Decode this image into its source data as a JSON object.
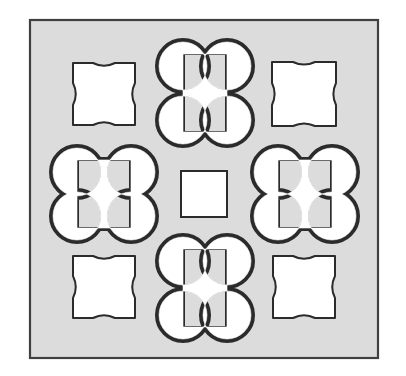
{
  "figure": {
    "kind": "geometric-tiling-pattern",
    "canvas": {
      "width": 406,
      "height": 376,
      "background": "#ffffff"
    },
    "frame": {
      "name": "outer-square-panel",
      "x": 30,
      "y": 20,
      "width": 348,
      "height": 338,
      "fill": "#dcdcdc",
      "stroke": "#404040",
      "stroke_width": 2.2
    },
    "shape_style": {
      "fill": "#ffffff",
      "stroke": "#2b2b2b",
      "stroke_width": 2.0
    },
    "grid": {
      "columns": 3,
      "rows": 3,
      "column_centers": [
        104,
        204,
        304
      ],
      "row_centers": [
        94,
        194,
        287
      ]
    },
    "shapes": [
      {
        "name": "concave-square-top-left",
        "type": "concave-square",
        "cx": 104,
        "cy": 94,
        "half": 31,
        "flat": 11,
        "note": "square with four inward (concave) arcs"
      },
      {
        "name": "clover-top-center",
        "type": "clover-vertical",
        "cx": 205,
        "cy": 93,
        "lobe_r": 26,
        "offset_x": 22,
        "offset_y": 27
      },
      {
        "name": "concave-square-top-right",
        "type": "concave-square",
        "cx": 304,
        "cy": 94,
        "half": 32,
        "flat": 11
      },
      {
        "name": "clover-middle-left",
        "type": "clover-horizontal",
        "cx": 104,
        "cy": 194,
        "lobe_r": 26,
        "offset_x": 27,
        "offset_y": 22
      },
      {
        "name": "center-square",
        "type": "square",
        "cx": 204,
        "cy": 194,
        "half": 23
      },
      {
        "name": "clover-middle-right",
        "type": "clover-horizontal",
        "cx": 305,
        "cy": 194,
        "lobe_r": 26,
        "offset_x": 27,
        "offset_y": 22
      },
      {
        "name": "concave-square-bottom-left",
        "type": "concave-square",
        "cx": 104,
        "cy": 287,
        "half": 31,
        "flat": 11
      },
      {
        "name": "clover-bottom-center",
        "type": "clover-vertical",
        "cx": 205,
        "cy": 288,
        "lobe_r": 26,
        "offset_x": 22,
        "offset_y": 27
      },
      {
        "name": "concave-square-bottom-right",
        "type": "concave-square",
        "cx": 304,
        "cy": 287,
        "half": 31,
        "flat": 11
      }
    ]
  }
}
